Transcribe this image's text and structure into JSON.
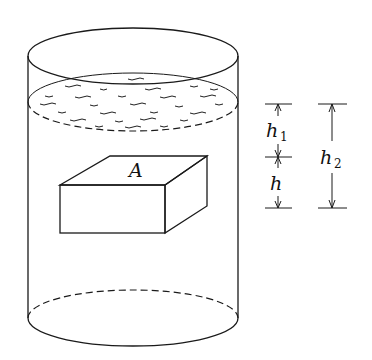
{
  "diagram": {
    "colors": {
      "ink": "#1a1a1a",
      "background": "#ffffff"
    },
    "block": {
      "label": "A"
    },
    "dimensions": {
      "h1": {
        "symbol": "h",
        "subscript": "1"
      },
      "h": {
        "symbol": "h",
        "subscript": ""
      },
      "h2": {
        "symbol": "h",
        "subscript": "2"
      }
    }
  }
}
